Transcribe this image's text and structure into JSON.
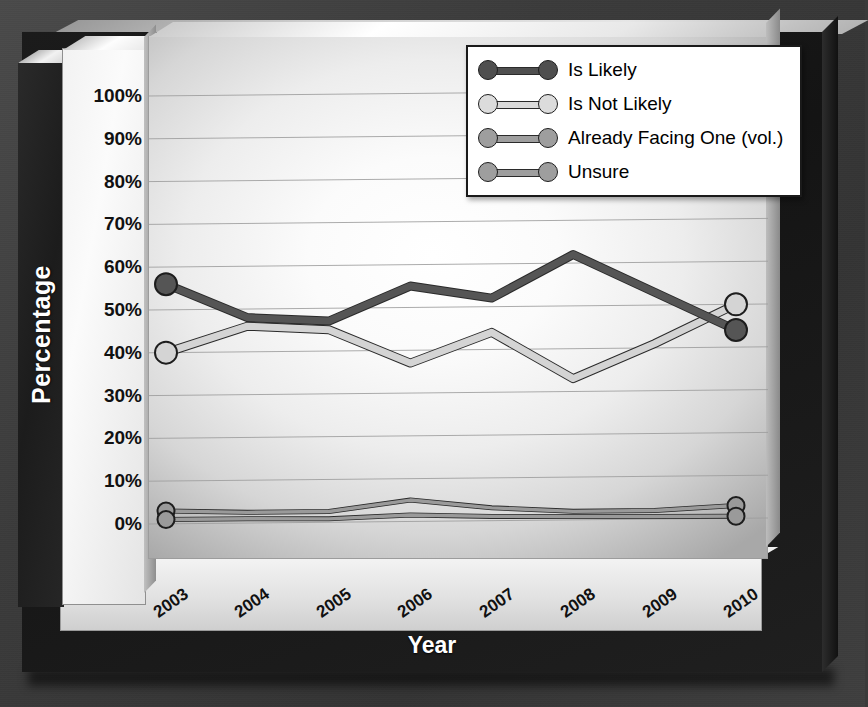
{
  "chart_data": {
    "type": "line",
    "title": "",
    "xlabel": "Year",
    "ylabel": "Percentage",
    "categories": [
      "2003",
      "2004",
      "2005",
      "2006",
      "2007",
      "2008",
      "2009",
      "2010"
    ],
    "ylim": [
      0,
      100
    ],
    "ytick_labels": [
      "0%",
      "10%",
      "20%",
      "30%",
      "40%",
      "50%",
      "60%",
      "70%",
      "80%",
      "90%",
      "100%"
    ],
    "ytick_values": [
      0,
      10,
      20,
      30,
      40,
      50,
      60,
      70,
      80,
      90,
      100
    ],
    "grid": true,
    "legend_position": "top-right",
    "series": [
      {
        "name": "Is Likely",
        "color": "#555555",
        "values": [
          56,
          48,
          47,
          55,
          52,
          62,
          53,
          44
        ]
      },
      {
        "name": "Is Not Likely",
        "color": "#d4d4d4",
        "values": [
          40,
          46,
          45,
          37,
          44,
          33,
          41,
          50
        ]
      },
      {
        "name": "Already Facing One (vol.)",
        "color": "#9a9a9a",
        "values": [
          3,
          2.5,
          2.5,
          5,
          3,
          2,
          2,
          3
        ]
      },
      {
        "name": "Unsure",
        "color": "#9a9a9a",
        "values": [
          1,
          1,
          0.8,
          1.5,
          1,
          0.8,
          0.6,
          0.5
        ]
      }
    ]
  },
  "axis": {
    "y_title": "Percentage",
    "x_title": "Year"
  },
  "legend": {
    "items": [
      {
        "label": "Is Likely",
        "color": "#4f4f4f"
      },
      {
        "label": "Is Not Likely",
        "color": "#dcdcdc"
      },
      {
        "label": "Already Facing One (vol.)",
        "color": "#9e9e9e"
      },
      {
        "label": "Unsure",
        "color": "#9e9e9e"
      }
    ]
  }
}
